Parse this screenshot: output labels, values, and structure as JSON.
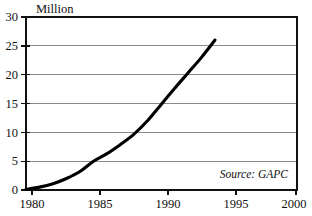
{
  "chart_data": {
    "type": "line",
    "title": "",
    "unit_label": "Million",
    "xlabel": "",
    "ylabel": "Million",
    "xlim": [
      1980,
      2000
    ],
    "ylim": [
      0,
      30
    ],
    "grid": "horizontal",
    "legend": "none",
    "annotations": [
      {
        "text": "Source: GAPC",
        "position": "bottom-right-inside-plot",
        "style": "italic"
      }
    ],
    "x_ticks": [
      1980,
      1985,
      1990,
      1995,
      2000
    ],
    "x_tick_labels": [
      "1980",
      "1985",
      "1990",
      "1995",
      "2000"
    ],
    "y_ticks": [
      0,
      5,
      10,
      15,
      20,
      25,
      30
    ],
    "y_tick_labels": [
      "0",
      "5",
      "10",
      "15",
      "20",
      "25",
      "30"
    ],
    "series": [
      {
        "name": "Million",
        "color": "#000000",
        "x": [
          1980,
          1981,
          1982,
          1983,
          1984,
          1985,
          1986,
          1987,
          1988,
          1989,
          1990,
          1991,
          1992,
          1993,
          1994
        ],
        "values": [
          0.1,
          0.5,
          1.1,
          2.0,
          3.2,
          5.0,
          6.3,
          7.9,
          9.7,
          12.0,
          14.8,
          17.6,
          20.3,
          23.0,
          26.0
        ]
      }
    ]
  },
  "labels": {
    "unit_title": "Million",
    "source": "Source: GAPC"
  }
}
